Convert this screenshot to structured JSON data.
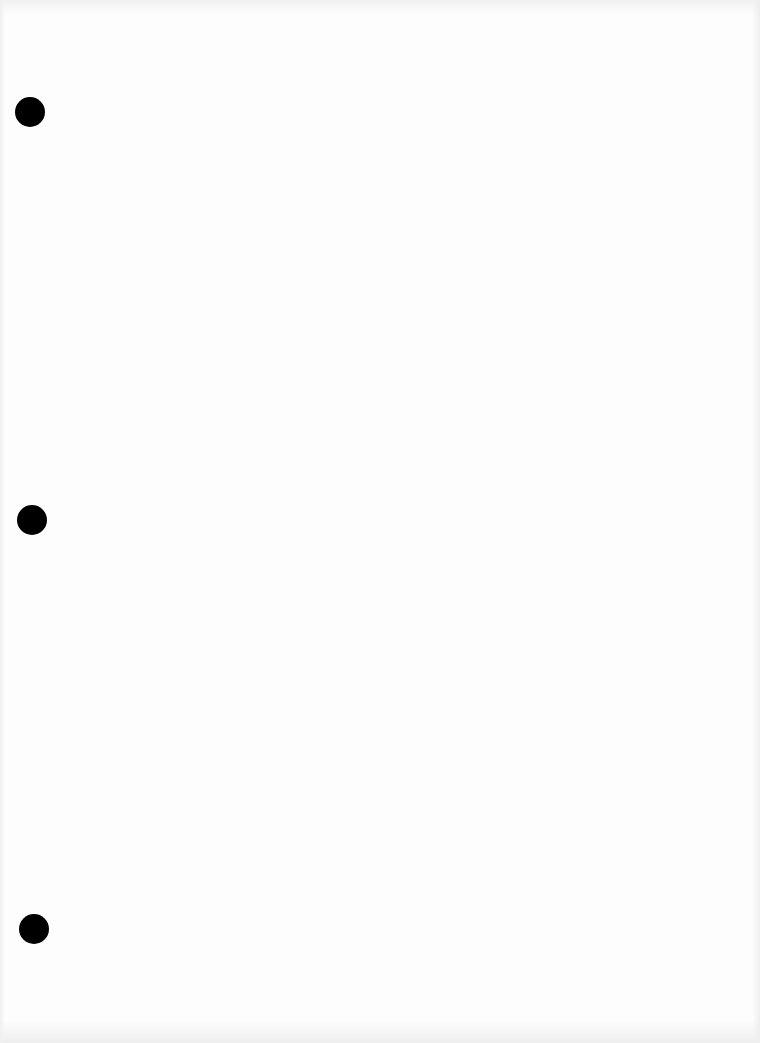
{
  "document": {
    "type": "blank scanned page",
    "text": "",
    "background_color": "#fdfdfd",
    "punch_holes": [
      {
        "cx": 30,
        "cy": 112,
        "r": 15,
        "color": "#000000"
      },
      {
        "cx": 32,
        "cy": 520,
        "r": 15,
        "color": "#000000"
      },
      {
        "cx": 34,
        "cy": 929,
        "r": 15,
        "color": "#000000"
      }
    ]
  }
}
